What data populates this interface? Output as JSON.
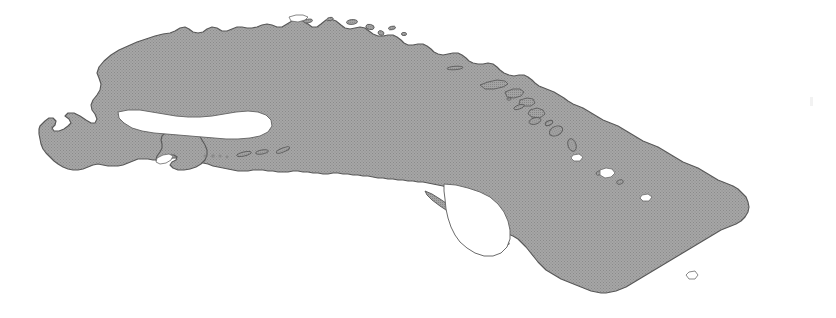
{
  "figure": {
    "kind": "map",
    "subject_name": "Cuba",
    "projection_note": "silhouette outline map",
    "width_px": 836,
    "height_px": 318,
    "background_color": "#ffffff",
    "land_fill_color": "#9b9b9b",
    "land_fill_pattern": "halftone-dither",
    "land_dither_dot_color": "#7e7e7e",
    "outline_color": "#4a4a4a",
    "outline_width_px": 1.1,
    "has_labels": false,
    "has_legend": false,
    "has_scalebar": false,
    "has_border_frame": false,
    "visible_text": ""
  },
  "features": {
    "main_island": {
      "name": "main-island",
      "description": "long curved main island of Cuba running west-northwest to east-southeast"
    },
    "isla_de_la_juventud": {
      "name": "isla-de-la-juventud",
      "description": "large rounded island off the south-west coast"
    },
    "canarreos_cays": {
      "name": "canarreos-cays",
      "description": "chain of small cays east of Isla de la Juventud",
      "count": 7
    },
    "jardines_de_la_reina_cays": {
      "name": "jardines-de-la-reina-cays",
      "description": "thin elongated cay chain off the south-central coast",
      "count": 3
    },
    "sabana_camaguey_cays": {
      "name": "sabana-camaguey-cays",
      "description": "chain of cays along the north-central and north-eastern coast",
      "count": 12
    },
    "northwest_cays": {
      "name": "northwest-cays",
      "description": "small cays along the north-west coast",
      "count": 6
    },
    "artifact_mark": {
      "name": "scan-artifact-mark",
      "description": "very faint grey speck near the right edge"
    }
  },
  "colors": {
    "land": "#9b9b9b",
    "land_dark": "#8d8d8d",
    "outline": "#4a4a4a",
    "background": "#ffffff",
    "artifact": "#f2f2f2"
  }
}
